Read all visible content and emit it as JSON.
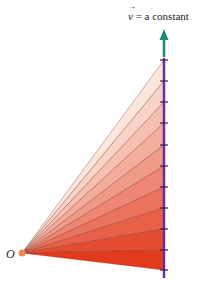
{
  "diagram": {
    "velocity_label": {
      "symbol": "v",
      "equals": " = ",
      "text": "a constant"
    },
    "origin_label": "O",
    "origin": {
      "x": 22,
      "y": 253
    },
    "line_x": 164,
    "tick_y": [
      60,
      81,
      102,
      123,
      145,
      166,
      187,
      208,
      229,
      250,
      270
    ],
    "colors": {
      "arrow": "#1e8a6e",
      "path_line": "#6a2c9e",
      "origin_dot": "#f08a50",
      "fan_top": "#fbe6dc",
      "fan_bottom": "#e23a1e",
      "fan_stroke": "#7a2e20"
    }
  }
}
